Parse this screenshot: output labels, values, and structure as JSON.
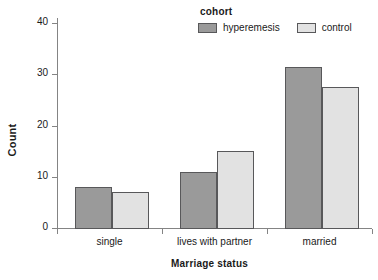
{
  "chart_data": {
    "type": "bar",
    "title": "",
    "subtitle": "",
    "xlabel": "Marriage status",
    "ylabel": "Count",
    "categories": [
      "single",
      "lives with partner",
      "married"
    ],
    "series": [
      {
        "name": "hyperemesis",
        "values": [
          8,
          11,
          31.5
        ],
        "color": "#9a9a9a"
      },
      {
        "name": "control",
        "values": [
          7,
          15,
          27.5
        ],
        "color": "#e2e2e2"
      }
    ],
    "legend": {
      "title": "cohort",
      "position": "top-right",
      "entries": [
        "hyperemesis",
        "control"
      ]
    },
    "ylim": [
      0,
      41
    ],
    "yticks": [
      0,
      10,
      20,
      30,
      40
    ],
    "ytick_labels": [
      "0",
      "10",
      "20",
      "30",
      "40"
    ],
    "grid": false,
    "bar_edge_color": "#58585a",
    "axis_color": "#848484",
    "background": "#ffffff"
  }
}
